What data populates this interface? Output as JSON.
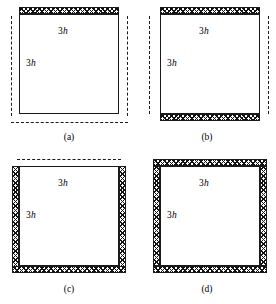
{
  "figure": {
    "labels": {
      "top_dimension": "3h",
      "side_dimension": "3h"
    },
    "colors": {
      "line": "#1a1a1a",
      "hatch": "#111111",
      "background": "#ffffff"
    },
    "panels": [
      {
        "id": "a",
        "caption": "(a)",
        "top_label": "3h",
        "side_label": "3h",
        "hatched_edges": [
          "top"
        ],
        "dashed_edges": [
          "left",
          "right",
          "bottom"
        ]
      },
      {
        "id": "b",
        "caption": "(b)",
        "top_label": "3h",
        "side_label": "3h",
        "hatched_edges": [
          "top",
          "bottom"
        ],
        "dashed_edges": [
          "left",
          "right"
        ]
      },
      {
        "id": "c",
        "caption": "(c)",
        "top_label": "3h",
        "side_label": "3h",
        "hatched_edges": [
          "left",
          "right",
          "bottom"
        ],
        "dashed_edges": [
          "top"
        ]
      },
      {
        "id": "d",
        "caption": "(d)",
        "top_label": "3h",
        "side_label": "3h",
        "hatched_edges": [
          "top",
          "bottom",
          "left",
          "right"
        ],
        "dashed_edges": []
      }
    ]
  }
}
